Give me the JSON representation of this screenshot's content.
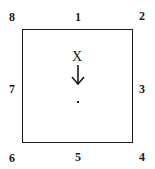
{
  "diagram": {
    "shape": "square",
    "positions": [
      {
        "id": "1",
        "label": "1",
        "location": "top-center",
        "x": 78,
        "y": 17
      },
      {
        "id": "2",
        "label": "2",
        "location": "top-right",
        "x": 142,
        "y": 16
      },
      {
        "id": "3",
        "label": "3",
        "location": "right-middle",
        "x": 142,
        "y": 89
      },
      {
        "id": "4",
        "label": "4",
        "location": "bottom-right",
        "x": 142,
        "y": 157
      },
      {
        "id": "5",
        "label": "5",
        "location": "bottom-center",
        "x": 78,
        "y": 157
      },
      {
        "id": "6",
        "label": "6",
        "location": "bottom-left",
        "x": 12,
        "y": 158
      },
      {
        "id": "7",
        "label": "7",
        "location": "left-middle",
        "x": 12,
        "y": 89
      },
      {
        "id": "8",
        "label": "8",
        "location": "top-left",
        "x": 12,
        "y": 17
      }
    ],
    "center_marker": {
      "label": "X",
      "arrow": "down",
      "target": "center-dot"
    },
    "colors": {
      "stroke": "#1a1a1a",
      "background": "#ffffff"
    }
  }
}
